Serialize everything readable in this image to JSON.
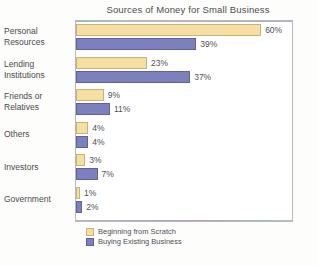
{
  "chart_data": {
    "type": "bar",
    "orientation": "horizontal",
    "title": "Sources of Money for Small Business",
    "xlabel": "",
    "ylabel": "",
    "xlim": [
      0,
      60
    ],
    "grid": false,
    "legend_position": "bottom-left",
    "value_suffix": "%",
    "categories": [
      "Personal Resources",
      "Lending Institutions",
      "Friends or Relatives",
      "Others",
      "Investors",
      "Government"
    ],
    "category_lines": [
      [
        "Personal",
        "Resources"
      ],
      [
        "Lending",
        "Institutions"
      ],
      [
        "Friends or",
        "Relatives"
      ],
      [
        "Others"
      ],
      [
        "Investors"
      ],
      [
        "Government"
      ]
    ],
    "series": [
      {
        "name": "Beginning from Scratch",
        "color": "#f6dfa3",
        "values": [
          60,
          23,
          9,
          4,
          3,
          1
        ],
        "labels": [
          "60%",
          "23%",
          "9%",
          "4%",
          "3%",
          "1%"
        ]
      },
      {
        "name": "Buying Existing Business",
        "color": "#7c80bd",
        "values": [
          39,
          37,
          11,
          4,
          7,
          2
        ],
        "labels": [
          "39%",
          "37%",
          "11%",
          "4%",
          "7%",
          "2%"
        ]
      }
    ]
  },
  "legend": {
    "items": [
      {
        "label": "Beginning from Scratch"
      },
      {
        "label": "Buying Existing Business"
      }
    ]
  }
}
